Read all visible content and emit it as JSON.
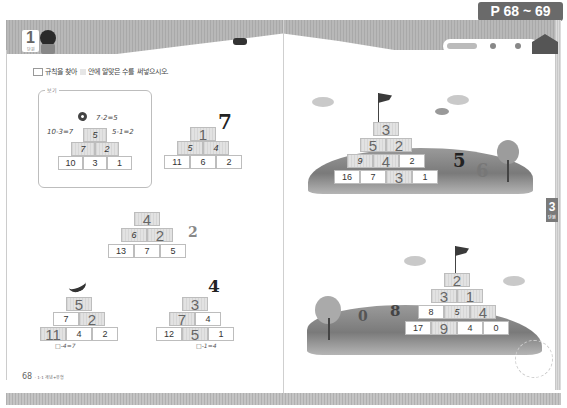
{
  "header": {
    "page_range": "P 68 ~ 69",
    "unit_number": "1",
    "unit_label": "단원"
  },
  "instruction": {
    "text_before": "규칙을 찾아",
    "text_after": "안에 알맞은 수를 써넣으시오."
  },
  "example": {
    "label": "보기",
    "annotations": [
      "7-2=5",
      "10-3=7",
      "5-1=2"
    ],
    "rows": [
      [
        "5"
      ],
      [
        "7",
        "2"
      ],
      [
        "10",
        "3",
        "1"
      ]
    ]
  },
  "pyramids": {
    "p1": {
      "rows": [
        [
          "1"
        ],
        [
          "5",
          "4"
        ],
        [
          "11",
          "6",
          "2"
        ]
      ],
      "deco": "7"
    },
    "p2": {
      "rows": [
        [
          "4"
        ],
        [
          "6",
          "2"
        ],
        [
          "13",
          "7",
          "5"
        ]
      ],
      "deco": "2"
    },
    "p3": {
      "rows": [
        [
          "5"
        ],
        [
          "7",
          "2"
        ],
        [
          "11",
          "4",
          "2"
        ]
      ],
      "hint": "□-4=7"
    },
    "p4": {
      "rows": [
        [
          "3"
        ],
        [
          "7",
          "4"
        ],
        [
          "12",
          "5",
          "1"
        ]
      ],
      "hint": "□-1=4",
      "deco": "4"
    },
    "p5": {
      "rows": [
        [
          "3"
        ],
        [
          "5",
          "2"
        ],
        [
          "9",
          "4",
          "2"
        ],
        [
          "16",
          "7",
          "3",
          "1"
        ]
      ],
      "deco": [
        "5",
        "6"
      ]
    },
    "p6": {
      "rows": [
        [
          "2"
        ],
        [
          "3",
          "1"
        ],
        [
          "8",
          "5",
          "4"
        ],
        [
          "17",
          "9",
          "4",
          "0"
        ]
      ],
      "deco": [
        "0",
        "8"
      ]
    }
  },
  "footer": {
    "page_number": "68",
    "book_label": "· 1-1 개념+유형"
  },
  "side_tab": {
    "number": "3",
    "label": "단원"
  }
}
